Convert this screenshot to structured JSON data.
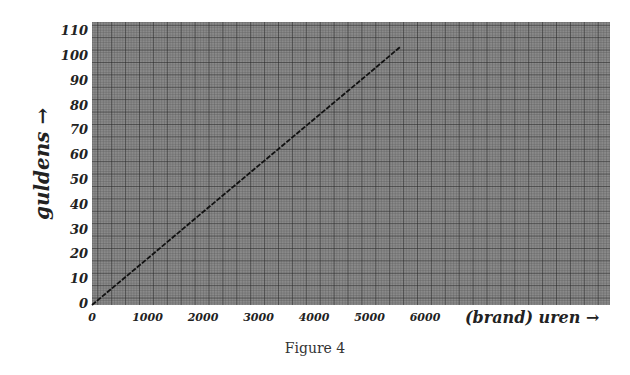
{
  "chart_data": {
    "type": "line",
    "title": "",
    "caption": "Figure 4",
    "xlabel": "(brand) uren →",
    "ylabel": "guldens →",
    "x_ticks": [
      "0",
      "1000",
      "2000",
      "3000",
      "4000",
      "5000",
      "6000"
    ],
    "y_ticks": [
      "0",
      "10",
      "20",
      "30",
      "40",
      "50",
      "60",
      "70",
      "80",
      "90",
      "100",
      "110"
    ],
    "xlim": [
      0,
      9300
    ],
    "ylim": [
      0,
      110
    ],
    "grid": true,
    "series": [
      {
        "name": "guldens",
        "x": [
          0,
          1000,
          2000,
          3000,
          4000,
          5000,
          5550
        ],
        "y": [
          0,
          18.7,
          37.5,
          56.2,
          74.9,
          93.6,
          104
        ]
      }
    ]
  },
  "labels": {
    "xlabel": "(brand) uren →",
    "ylabel": "guldens →",
    "caption": "Figure 4",
    "x_ticks": [
      "0",
      "1000",
      "2000",
      "3000",
      "4000",
      "5000",
      "6000"
    ],
    "y_ticks": [
      "0",
      "10",
      "20",
      "30",
      "40",
      "50",
      "60",
      "70",
      "80",
      "90",
      "100",
      "110"
    ]
  }
}
